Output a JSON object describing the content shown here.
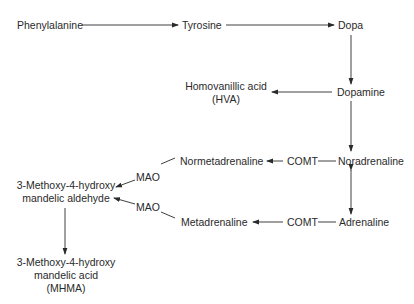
{
  "diagram": {
    "nodes": {
      "phenylalanine": "Phenylalanine",
      "tyrosine": "Tyrosine",
      "dopa": "Dopa",
      "dopamine": "Dopamine",
      "hva_line1": "Homovanillic acid",
      "hva_line2": "(HVA)",
      "noradrenaline": "Noradrenaline",
      "adrenaline": "Adrenaline",
      "normetadrenaline": "Normetadrenaline",
      "metadrenaline": "Metadrenaline",
      "aldehyde_line1": "3-Methoxy-4-hydroxy",
      "aldehyde_line2": "mandelic aldehyde",
      "mhma_line1": "3-Methoxy-4-hydroxy",
      "mhma_line2": "mandelic acid",
      "mhma_line3": "(MHMA)"
    },
    "enzymes": {
      "comt_upper": "COMT",
      "comt_lower": "COMT",
      "mao_upper": "MAO",
      "mao_lower": "MAO"
    },
    "edges": [
      {
        "from": "Phenylalanine",
        "to": "Tyrosine"
      },
      {
        "from": "Tyrosine",
        "to": "Dopa"
      },
      {
        "from": "Dopa",
        "to": "Dopamine"
      },
      {
        "from": "Dopamine",
        "to": "Homovanillic acid (HVA)"
      },
      {
        "from": "Dopamine",
        "to": "Noradrenaline"
      },
      {
        "from": "Noradrenaline",
        "to": "Adrenaline",
        "bidirectional": true
      },
      {
        "from": "Noradrenaline",
        "to": "Normetadrenaline",
        "enzyme": "COMT"
      },
      {
        "from": "Adrenaline",
        "to": "Metadrenaline",
        "enzyme": "COMT"
      },
      {
        "from": "Normetadrenaline",
        "to": "3-Methoxy-4-hydroxy mandelic aldehyde",
        "enzyme": "MAO"
      },
      {
        "from": "Metadrenaline",
        "to": "3-Methoxy-4-hydroxy mandelic aldehyde",
        "enzyme": "MAO"
      },
      {
        "from": "3-Methoxy-4-hydroxy mandelic aldehyde",
        "to": "3-Methoxy-4-hydroxy mandelic acid (MHMA)"
      }
    ]
  }
}
